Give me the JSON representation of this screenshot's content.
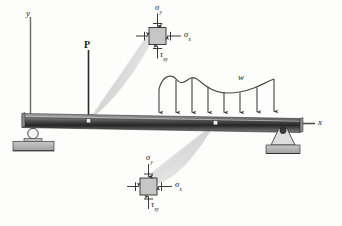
{
  "figure": {
    "background_color": "#fdfdfc"
  },
  "axes": {
    "y_label": "y",
    "x_label": "x"
  },
  "loads": {
    "point_load_label": "P",
    "distributed_load_label": "w",
    "arrow_count": 8
  },
  "supports": {
    "left": "roller-support",
    "right": "pin-support"
  },
  "beam": {
    "fill_top": "#9c9c9c",
    "fill_mid": "#2d2d2d",
    "fill_bottom": "#6f6f6f"
  },
  "stress_element_top": {
    "sigma_y": "σ",
    "sigma_y_sub": "y",
    "sigma_x": "σ",
    "sigma_x_sub": "x",
    "tau_xy": "τ",
    "tau_xy_sub": "xy"
  },
  "stress_element_bottom": {
    "sigma_y": "σ",
    "sigma_y_sub": "y",
    "sigma_x": "σ",
    "sigma_x_sub": "x",
    "tau_xy": "τ",
    "tau_xy_sub": "xy"
  },
  "colors": {
    "line": "#333333",
    "callout": "#d8d8d8",
    "element_fill": "#c6c6c6",
    "support_fill": "#b8b8b8"
  }
}
